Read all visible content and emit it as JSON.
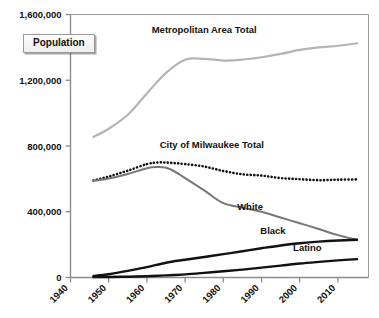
{
  "chart_data": {
    "type": "line",
    "title": "",
    "subtitle": "",
    "xlabel": "",
    "ylabel": "Population",
    "xlim": [
      1940,
      2018
    ],
    "ylim": [
      0,
      1600000
    ],
    "grid": false,
    "legend_position": "inline-labels",
    "y_ticks": [
      0,
      400000,
      800000,
      1200000,
      1600000
    ],
    "y_tick_labels": [
      "0",
      "400,000",
      "800,000",
      "1,200,000",
      "1,600,000"
    ],
    "x_ticks": [
      1940,
      1950,
      1960,
      1970,
      1980,
      1990,
      2000,
      2010
    ],
    "x_tick_labels": [
      "1940",
      "1950",
      "1960",
      "1970",
      "1980",
      "1990",
      "2000",
      "2010"
    ],
    "series": [
      {
        "name": "Metropolitan Area Total",
        "label": "Metropolitan Area Total",
        "color": "#b4b4b4",
        "style": "solid",
        "width": 2.2,
        "label_x": 1975,
        "label_y": 1490000,
        "x": [
          1946,
          1950,
          1955,
          1960,
          1965,
          1970,
          1975,
          1980,
          1985,
          1990,
          1995,
          2000,
          2005,
          2010,
          2015
        ],
        "y": [
          855000,
          905000,
          990000,
          1120000,
          1245000,
          1325000,
          1330000,
          1320000,
          1325000,
          1340000,
          1360000,
          1385000,
          1400000,
          1410000,
          1425000
        ]
      },
      {
        "name": "City of Milwaukee Total",
        "label": "City of Milwaukee Total",
        "color": "#111111",
        "style": "dotted",
        "width": 2.6,
        "label_x": 1977,
        "label_y": 790000,
        "x": [
          1946,
          1950,
          1955,
          1960,
          1963,
          1966,
          1970,
          1975,
          1980,
          1985,
          1990,
          1995,
          2000,
          2005,
          2010,
          2015
        ],
        "y": [
          590000,
          614000,
          650000,
          690000,
          700000,
          698000,
          690000,
          675000,
          648000,
          628000,
          620000,
          605000,
          598000,
          592000,
          595000,
          597000
        ]
      },
      {
        "name": "White",
        "label": "White",
        "color": "#777777",
        "style": "solid",
        "width": 2.0,
        "label_x": 1987,
        "label_y": 410000,
        "x": [
          1946,
          1950,
          1955,
          1960,
          1963,
          1966,
          1970,
          1975,
          1980,
          1985,
          1990,
          1995,
          2000,
          2005,
          2010,
          2015
        ],
        "y": [
          588000,
          602000,
          630000,
          665000,
          672000,
          660000,
          605000,
          530000,
          452000,
          425000,
          400000,
          365000,
          330000,
          295000,
          258000,
          230000
        ]
      },
      {
        "name": "Black",
        "label": "Black",
        "color": "#111111",
        "style": "solid",
        "width": 2.4,
        "label_x": 1993,
        "label_y": 265000,
        "x": [
          1946,
          1950,
          1955,
          1960,
          1965,
          1970,
          1975,
          1980,
          1985,
          1990,
          1995,
          2000,
          2005,
          2010,
          2015
        ],
        "y": [
          9000,
          20000,
          40000,
          63000,
          90000,
          108000,
          125000,
          142000,
          160000,
          178000,
          195000,
          208000,
          218000,
          225000,
          230000
        ]
      },
      {
        "name": "Latino",
        "label": "Latino",
        "color": "#111111",
        "style": "solid",
        "width": 2.4,
        "label_x": 2002,
        "label_y": 160000,
        "x": [
          1946,
          1950,
          1955,
          1960,
          1965,
          1970,
          1975,
          1980,
          1985,
          1990,
          1995,
          2000,
          2005,
          2010,
          2015
        ],
        "y": [
          2000,
          3000,
          5000,
          8000,
          13000,
          19000,
          28000,
          38000,
          48000,
          60000,
          72000,
          85000,
          95000,
          104000,
          112000
        ]
      }
    ]
  },
  "y_axis_title_box": {
    "label": "Population"
  }
}
